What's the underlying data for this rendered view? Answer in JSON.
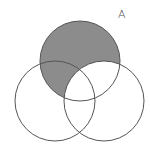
{
  "diagram": {
    "type": "venn",
    "label": "A",
    "circles": [
      {
        "name": "top",
        "cx": 80,
        "cy": 61,
        "r": 40
      },
      {
        "name": "left",
        "cx": 55,
        "cy": 101,
        "r": 40
      },
      {
        "name": "right",
        "cx": 104,
        "cy": 101,
        "r": 40
      }
    ],
    "shaded_region": "top minus right",
    "colors": {
      "shade": "#8c8c8c",
      "stroke": "#555555",
      "background": "#ffffff"
    }
  }
}
